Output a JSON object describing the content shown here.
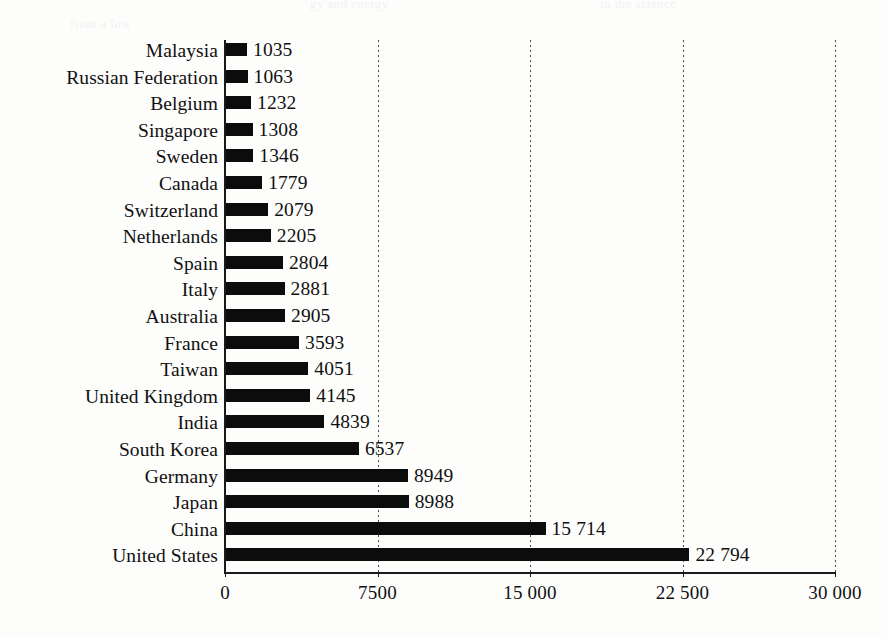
{
  "chart_data": {
    "type": "bar",
    "orientation": "horizontal",
    "title": "",
    "xlabel": "",
    "ylabel": "",
    "xlim": [
      0,
      30000
    ],
    "grid": true,
    "legend": "none",
    "xticks": [
      0,
      7500,
      15000,
      22500,
      30000
    ],
    "xtick_labels": [
      "0",
      "7500",
      "15 000",
      "22 500",
      "30 000"
    ],
    "categories": [
      "Malaysia",
      "Russian Federation",
      "Belgium",
      "Singapore",
      "Sweden",
      "Canada",
      "Switzerland",
      "Netherlands",
      "Spain",
      "Italy",
      "Australia",
      "France",
      "Taiwan",
      "United Kingdom",
      "India",
      "South Korea",
      "Germany",
      "Japan",
      "China",
      "United States"
    ],
    "values": [
      1035,
      1063,
      1232,
      1308,
      1346,
      1779,
      2079,
      2205,
      2804,
      2881,
      2905,
      3593,
      4051,
      4145,
      4839,
      6537,
      8949,
      8988,
      15714,
      22794
    ],
    "value_labels": [
      "1035",
      "1063",
      "1232",
      "1308",
      "1346",
      "1779",
      "2079",
      "2205",
      "2804",
      "2881",
      "2905",
      "3593",
      "4051",
      "4145",
      "4839",
      "6537",
      "8949",
      "8988",
      "15 714",
      "22 794"
    ],
    "bar_color": "#0c0c0c",
    "background_color": "#fdfdfc",
    "axis_color": "#1a1a1a"
  },
  "ghost_text": {
    "lines": [
      "gy and energy",
      "in the science",
      "from a low"
    ]
  }
}
